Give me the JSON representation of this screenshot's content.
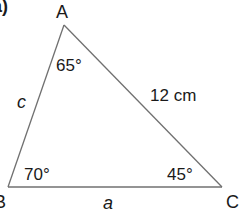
{
  "part_label": "a)",
  "vertices": {
    "A": {
      "label": "A",
      "angle": "65°"
    },
    "B": {
      "label": "B",
      "angle": "70°"
    },
    "C": {
      "label": "C",
      "angle": "45°"
    }
  },
  "sides": {
    "AB": "c",
    "BC": "a",
    "AC": "12 cm"
  },
  "colors": {
    "line": "#707070",
    "text": "#1a1a1a"
  }
}
